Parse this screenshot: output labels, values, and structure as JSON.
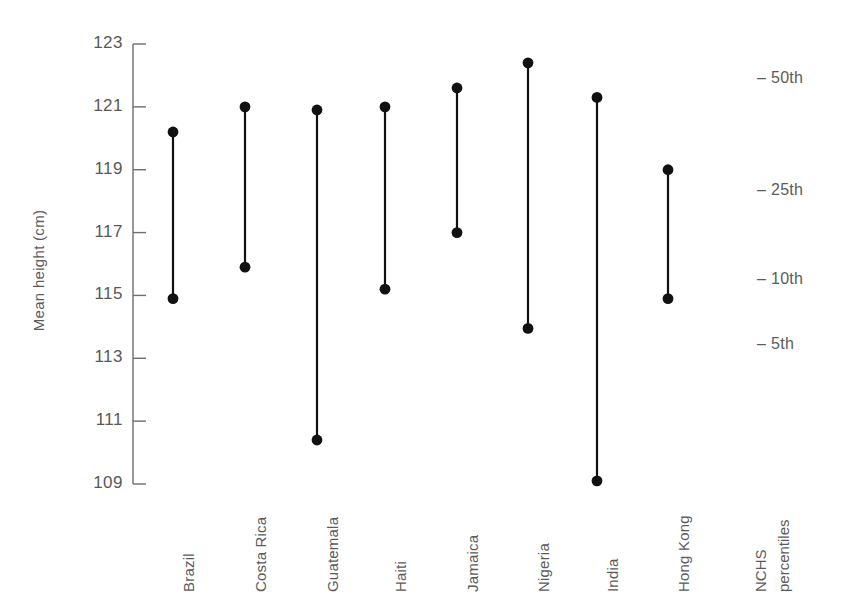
{
  "chart_data": {
    "type": "scatter",
    "subtype": "dumbbell-range-plot",
    "title": "",
    "xlabel": "",
    "ylabel": "Mean height (cm)",
    "ylim": [
      109,
      123
    ],
    "yticks": [
      109,
      111,
      113,
      115,
      117,
      119,
      121,
      123
    ],
    "ytick_labels": [
      "109",
      "111",
      "113",
      "115",
      "117",
      "119",
      "121",
      "123"
    ],
    "grid": false,
    "legend_position": "right",
    "categories": [
      "Brazil",
      "Costa Rica",
      "Guatemala",
      "Haiti",
      "Jamaica",
      "Nigeria",
      "India",
      "Hong Kong"
    ],
    "series": [
      {
        "name": "upper",
        "values": [
          120.2,
          121.0,
          120.9,
          121.0,
          121.6,
          122.4,
          121.3,
          119.0
        ]
      },
      {
        "name": "lower",
        "values": [
          114.9,
          115.9,
          110.4,
          115.2,
          117.0,
          113.95,
          109.1,
          114.9
        ]
      }
    ],
    "points": [
      {
        "category": "Brazil",
        "upper": 120.2,
        "lower": 114.9
      },
      {
        "category": "Costa Rica",
        "upper": 121.0,
        "lower": 115.9
      },
      {
        "category": "Guatemala",
        "upper": 120.9,
        "lower": 110.4
      },
      {
        "category": "Haiti",
        "upper": 121.0,
        "lower": 115.2
      },
      {
        "category": "Jamaica",
        "upper": 121.6,
        "lower": 117.0
      },
      {
        "category": "Nigeria",
        "upper": 122.4,
        "lower": 113.95
      },
      {
        "category": "India",
        "upper": 121.3,
        "lower": 109.1
      },
      {
        "category": "Hong Kong",
        "upper": 119.0,
        "lower": 114.9
      }
    ],
    "reference_axis": {
      "label_line1": "NCHS",
      "label_line2": "percentiles",
      "ticks": [
        {
          "label": "50th",
          "height": 121.85
        },
        {
          "label": "25th",
          "height": 118.3
        },
        {
          "label": "10th",
          "height": 115.45
        },
        {
          "label": "5th",
          "height": 113.4
        }
      ]
    },
    "marker_color": "#111111",
    "line_color": "#111111",
    "text_color": "#5b5b5b"
  }
}
